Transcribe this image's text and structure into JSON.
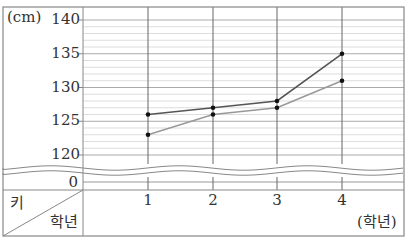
{
  "chart_data": {
    "type": "line",
    "title": "",
    "xlabel": "학년",
    "ylabel": "키",
    "y_unit": "(cm)",
    "x_unit": "(학년)",
    "corner_header": {
      "top_left": "키",
      "bottom_right": "학년"
    },
    "categories": [
      "1",
      "2",
      "3",
      "4"
    ],
    "y_ticks": [
      "140",
      "135",
      "130",
      "125",
      "120",
      "0"
    ],
    "ylim": [
      120,
      140
    ],
    "axis_break": true,
    "grid": {
      "major_step": 5,
      "minor_step": 1,
      "vertical_lines": true
    },
    "series": [
      {
        "name": "series-dark",
        "color": "#555555",
        "values": [
          126,
          127,
          128,
          135
        ]
      },
      {
        "name": "series-light",
        "color": "#999999",
        "values": [
          123,
          126,
          127,
          131
        ]
      }
    ],
    "legend": null
  },
  "labels": {
    "y_unit": "(cm)",
    "x_unit": "(학년)",
    "corner_top": "키",
    "corner_bottom": "학년",
    "zero_tick": "0"
  },
  "colors": {
    "frame": "#888888",
    "major_grid": "#aaaaaa",
    "minor_grid": "#dddddd",
    "vertical_grid": "#666666",
    "point": "#111111"
  }
}
